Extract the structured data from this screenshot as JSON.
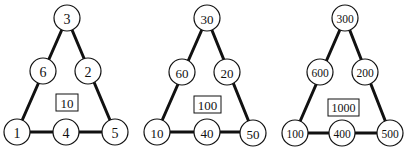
{
  "diagram": {
    "triangles": [
      {
        "total": "10",
        "nodes": {
          "top": "3",
          "left_mid": "6",
          "right_mid": "2",
          "bottom_left": "1",
          "bottom_mid": "4",
          "bottom_right": "5"
        }
      },
      {
        "total": "100",
        "nodes": {
          "top": "30",
          "left_mid": "60",
          "right_mid": "20",
          "bottom_left": "10",
          "bottom_mid": "40",
          "bottom_right": "50"
        }
      },
      {
        "total": "1000",
        "nodes": {
          "top": "300",
          "left_mid": "600",
          "right_mid": "200",
          "bottom_left": "100",
          "bottom_mid": "400",
          "bottom_right": "500"
        }
      }
    ]
  }
}
